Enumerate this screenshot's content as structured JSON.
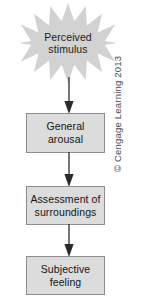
{
  "figure": {
    "background_color": "#ffffff"
  },
  "colors": {
    "node_fill": "#dcdcdc",
    "node_border": "#8d8d8d",
    "burst_fill": "#d2d2d2",
    "arrow": "#3c3c3c",
    "text": "#141414",
    "copyright_text": "#4a4a4a"
  },
  "nodes": [
    {
      "id": "perceived-stimulus",
      "shape": "starburst",
      "points": 14,
      "line1": "Perceived",
      "line2": "stimulus"
    },
    {
      "id": "general-arousal",
      "shape": "rectangle",
      "line1": "General",
      "line2": "arousal"
    },
    {
      "id": "assessment-of-surroundings",
      "shape": "rectangle",
      "line1": "Assessment of",
      "line2": "surroundings"
    },
    {
      "id": "subjective-feeling",
      "shape": "rectangle",
      "line1": "Subjective",
      "line2": "feeling"
    }
  ],
  "connectors": [
    {
      "id": "arrow-1",
      "from": "perceived-stimulus",
      "to": "general-arousal",
      "direction": "down"
    },
    {
      "id": "arrow-2",
      "from": "general-arousal",
      "to": "assessment-of-surroundings",
      "direction": "down"
    },
    {
      "id": "arrow-3",
      "from": "assessment-of-surroundings",
      "to": "subjective-feeling",
      "direction": "down"
    }
  ],
  "copyright": {
    "text": "© Cengage Learning 2013",
    "orientation": "rotated-90-ccw"
  }
}
